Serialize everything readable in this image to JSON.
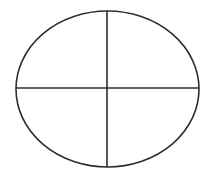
{
  "diagram": {
    "type": "ellipse-divided-into-quadrants",
    "background": "#ffffff",
    "stroke_color": "#2e2e2e",
    "stroke_width": 1.6,
    "ellipse": {
      "cx": 107.5,
      "cy": 89,
      "rx": 91.5,
      "ry": 78
    },
    "vertical_line": {
      "x1": 107,
      "y1": 11,
      "x2": 107,
      "y2": 167
    },
    "horizontal_line": {
      "x1": 16,
      "y1": 88,
      "x2": 199,
      "y2": 88
    }
  }
}
